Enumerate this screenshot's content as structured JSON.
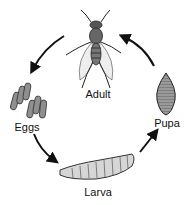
{
  "diagram": {
    "type": "life-cycle",
    "stages": [
      {
        "id": "adult",
        "label": "Adult",
        "icon": "adult-fly-icon"
      },
      {
        "id": "eggs",
        "label": "Eggs",
        "icon": "eggs-icon"
      },
      {
        "id": "larva",
        "label": "Larva",
        "icon": "larva-icon"
      },
      {
        "id": "pupa",
        "label": "Pupa",
        "icon": "pupa-icon"
      }
    ],
    "edges": [
      {
        "from": "adult",
        "to": "eggs"
      },
      {
        "from": "eggs",
        "to": "larva"
      },
      {
        "from": "larva",
        "to": "pupa"
      },
      {
        "from": "pupa",
        "to": "adult"
      }
    ],
    "direction": "counter-clockwise",
    "colors": {
      "ink": "#111111",
      "fill": "#8a8a8a",
      "light_fill": "#d8d8d8"
    }
  }
}
